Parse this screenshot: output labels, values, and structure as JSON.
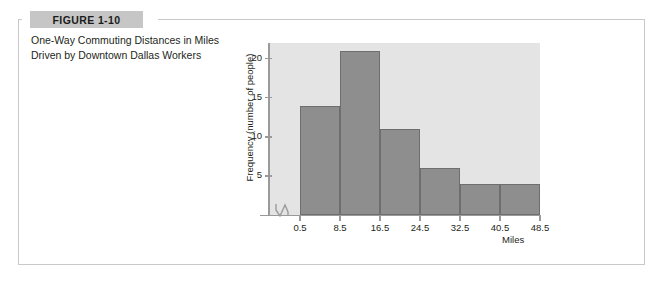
{
  "figure": {
    "badge_label": "FIGURE 1-10",
    "caption": "One-Way Commuting Distances in Miles Driven by Downtown Dallas Workers"
  },
  "colors": {
    "bar_fill": "#8e8e8e",
    "bar_stroke": "#6e6e6e",
    "plot_background": "#e4e4e4",
    "axis": "#9a9a9a",
    "badge_background": "#c6c6c6",
    "frame_border": "#c9c9c9",
    "text": "#231f20"
  },
  "chart_data": {
    "type": "bar",
    "title": "",
    "xlabel": "Miles",
    "ylabel": "Frequency (number of people)",
    "categories": [
      "0.5-8.5",
      "8.5-16.5",
      "16.5-24.5",
      "24.5-32.5",
      "32.5-40.5",
      "40.5-48.5"
    ],
    "values": [
      14,
      21,
      11,
      6,
      4,
      4
    ],
    "x_tick_labels": [
      "0.5",
      "8.5",
      "16.5",
      "24.5",
      "32.5",
      "40.5",
      "48.5"
    ],
    "x_tick_values": [
      0.5,
      8.5,
      16.5,
      24.5,
      32.5,
      40.5,
      48.5
    ],
    "y_tick_labels": [
      "5",
      "10",
      "15",
      "20"
    ],
    "y_tick_values": [
      5,
      10,
      15,
      20
    ],
    "ylim": [
      0,
      22
    ],
    "xlim": [
      0.5,
      48.5
    ],
    "grid": false,
    "legend": "none",
    "x_axis_break": true
  }
}
